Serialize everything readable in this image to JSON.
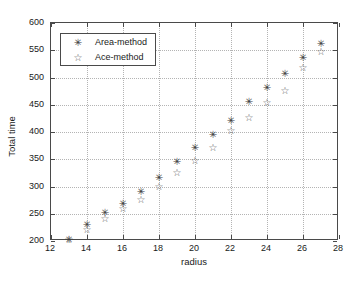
{
  "chart_data": {
    "type": "scatter",
    "title": "",
    "xlabel": "radius",
    "ylabel": "Total time",
    "xlim": [
      12,
      28
    ],
    "ylim": [
      200,
      600
    ],
    "xticks": [
      12,
      14,
      16,
      18,
      20,
      22,
      24,
      26,
      28
    ],
    "yticks": [
      200,
      250,
      300,
      350,
      400,
      450,
      500,
      550,
      600
    ],
    "grid": true,
    "legend_position": "upper left",
    "series": [
      {
        "name": "Area-method",
        "marker": "asterisk",
        "color": "#3c3c3c",
        "x": [
          13,
          14,
          15,
          16,
          17,
          18,
          19,
          20,
          21,
          22,
          23,
          24,
          25,
          26,
          27
        ],
        "y": [
          203,
          231,
          252,
          268,
          290,
          317,
          345,
          371,
          396,
          421,
          456,
          482,
          508,
          537,
          562
        ]
      },
      {
        "name": "Ace-method",
        "marker": "star-open",
        "color": "#5a5a5a",
        "x": [
          13,
          14,
          15,
          16,
          17,
          18,
          19,
          20,
          21,
          22,
          23,
          24,
          25,
          26,
          27
        ],
        "y": [
          202,
          222,
          241,
          260,
          276,
          300,
          325,
          347,
          372,
          402,
          426,
          454,
          476,
          518,
          548
        ]
      }
    ]
  },
  "legend": {
    "entries": [
      {
        "label": "Area-method",
        "glyph": "✳"
      },
      {
        "label": "Ace-method",
        "glyph": "☆"
      }
    ]
  },
  "glyphs": {
    "area_marker": "✳",
    "ace_marker": "☆"
  }
}
